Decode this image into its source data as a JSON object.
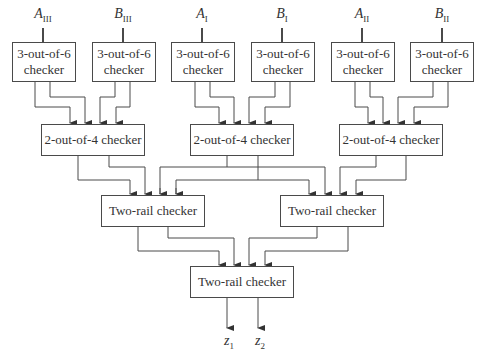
{
  "diagram": {
    "inputs": [
      {
        "var": "A",
        "sub": "III"
      },
      {
        "var": "B",
        "sub": "III"
      },
      {
        "var": "A",
        "sub": "I"
      },
      {
        "var": "B",
        "sub": "I"
      },
      {
        "var": "A",
        "sub": "II"
      },
      {
        "var": "B",
        "sub": "II"
      }
    ],
    "level1": [
      {
        "line1": "3-out-of-6",
        "line2": "checker"
      },
      {
        "line1": "3-out-of-6",
        "line2": "checker"
      },
      {
        "line1": "3-out-of-6",
        "line2": "checker"
      },
      {
        "line1": "3-out-of-6",
        "line2": "checker"
      },
      {
        "line1": "3-out-of-6",
        "line2": "checker"
      },
      {
        "line1": "3-out-of-6",
        "line2": "checker"
      }
    ],
    "level2": [
      {
        "label": "2-out-of-4 checker"
      },
      {
        "label": "2-out-of-4 checker"
      },
      {
        "label": "2-out-of-4 checker"
      }
    ],
    "level3": [
      {
        "label": "Two-rail checker"
      },
      {
        "label": "Two-rail checker"
      }
    ],
    "level4": {
      "label": "Two-rail checker"
    },
    "outputs": [
      {
        "var": "z",
        "sub": "1"
      },
      {
        "var": "z",
        "sub": "2"
      }
    ],
    "colors": {
      "line": "#4a4a4a",
      "text": "#333333",
      "background": "#ffffff"
    }
  }
}
